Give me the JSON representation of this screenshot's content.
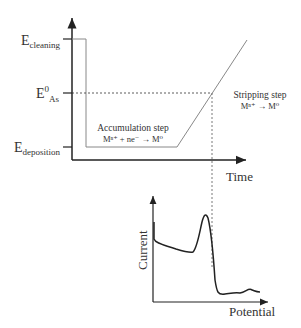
{
  "top_plot": {
    "y_labels": {
      "cleaning": {
        "main": "E",
        "sub": "cleaning"
      },
      "e0": {
        "main": "E",
        "sup": "0",
        "sub": "As"
      },
      "deposition": {
        "main": "E",
        "sub": "deposition"
      }
    },
    "x_axis_label": "Time",
    "accumulation": {
      "title": "Accumulation step",
      "reaction": "Mⁿ⁺ + ne⁻ → M⁰"
    },
    "stripping": {
      "title": "Stripping step",
      "reaction": "Mⁿ⁺ → M⁰"
    }
  },
  "bottom_plot": {
    "y_axis_label": "Current",
    "x_axis_label": "Potential"
  },
  "colors": {
    "axis": "#222222",
    "waveform": "#888888",
    "curve": "#222222"
  }
}
